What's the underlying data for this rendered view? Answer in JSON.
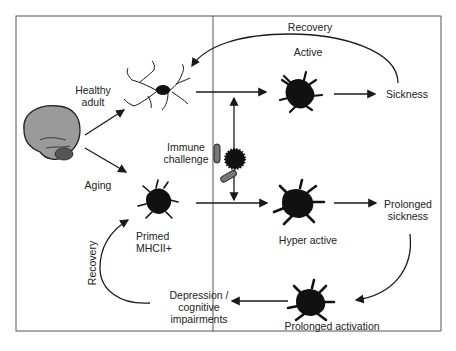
{
  "diagram": {
    "nodes": {
      "healthy_adult": "Healthy\nadult",
      "aging": "Aging",
      "immune_challenge": "Immune\nchallenge",
      "active": "Active",
      "sickness": "Sickness",
      "recovery_top": "Recovery",
      "primed": "Primed\nMHCII+",
      "hyper_active": "Hyper active",
      "prolonged_sickness": "Prolonged\nsickness",
      "prolonged_activation": "Prolonged activation",
      "depression": "Depression /\ncognitive\nimpairments",
      "recovery_left": "Recovery"
    },
    "icons": [
      "brain-icon",
      "ramified-microglia-icon",
      "activated-microglia-icon",
      "primed-microglia-icon",
      "pathogen-icon",
      "bacteria-icon"
    ],
    "colors": {
      "line": "#1a1a1a",
      "cell": "#111111",
      "brain": "#9a9a9a",
      "border": "#555555"
    }
  }
}
